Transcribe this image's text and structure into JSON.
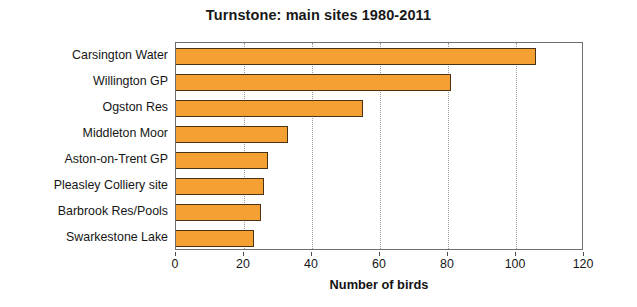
{
  "chart_data": {
    "type": "bar",
    "orientation": "horizontal",
    "title": "Turnstone: main sites 1980-2011",
    "xlabel": "Number of birds",
    "ylabel": "",
    "categories": [
      "Carsington Water",
      "Willington GP",
      "Ogston Res",
      "Middleton Moor",
      "Aston-on-Trent GP",
      "Pleasley Colliery site",
      "Barbrook Res/Pools",
      "Swarkestone Lake"
    ],
    "values": [
      106,
      81,
      55,
      33,
      27,
      26,
      25,
      23
    ],
    "xlim": [
      0,
      120
    ],
    "xticks": [
      0,
      20,
      40,
      60,
      80,
      100,
      120
    ],
    "grid": true,
    "grid_axis": "x",
    "legend": null,
    "bar_color": "#f5a033",
    "bar_edge_color": "#4a3216",
    "background_color": "#ffffff",
    "frame_color": "#6e6e6e"
  }
}
